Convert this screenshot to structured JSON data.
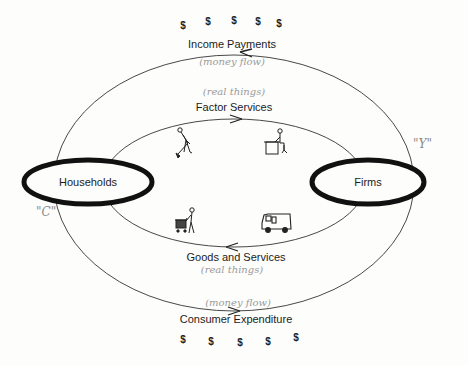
{
  "diagram": {
    "type": "circular-flow",
    "nodes": {
      "households": {
        "label": "Households"
      },
      "firms": {
        "label": "Firms"
      }
    },
    "outer_loop": {
      "top": {
        "label": "Income Payments",
        "annotation": "(money flow)",
        "direction": "firms-to-households",
        "dollar_signs": [
          "$",
          "$",
          "$",
          "$",
          "$"
        ]
      },
      "bottom": {
        "label": "Consumer Expenditure",
        "annotation": "(money flow)",
        "direction": "households-to-firms",
        "dollar_signs": [
          "$",
          "$",
          "$",
          "$",
          "$"
        ]
      }
    },
    "inner_loop": {
      "top": {
        "label": "Factor Services",
        "annotation": "(real things)",
        "direction": "households-to-firms",
        "icons": [
          "worker-digging-icon",
          "office-worker-at-desk-icon"
        ]
      },
      "bottom": {
        "label": "Goods and Services",
        "annotation": "(real things)",
        "direction": "firms-to-households",
        "icons": [
          "shopper-with-cart-icon",
          "delivery-van-icon"
        ]
      }
    },
    "handwritten_marks": {
      "consumption": "\"C\"",
      "income": "\"Y\""
    }
  }
}
